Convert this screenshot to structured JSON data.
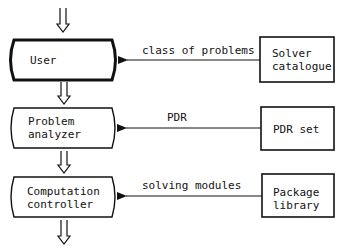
{
  "diagram": {
    "left_column": [
      {
        "id": "user",
        "label_lines": [
          "User"
        ],
        "emphasized": true
      },
      {
        "id": "problem-analyzer",
        "label_lines": [
          "Problem",
          "analyzer"
        ],
        "emphasized": false
      },
      {
        "id": "computation-controller",
        "label_lines": [
          "Computation",
          "controller"
        ],
        "emphasized": false
      }
    ],
    "right_column": [
      {
        "id": "solver-catalogue",
        "label_lines": [
          "Solver",
          "catalogue"
        ]
      },
      {
        "id": "pdr-set",
        "label_lines": [
          "PDR set"
        ]
      },
      {
        "id": "package-library",
        "label_lines": [
          "Package",
          "library"
        ]
      }
    ],
    "connections": [
      {
        "from": "solver-catalogue",
        "to": "user",
        "label": "class of problems"
      },
      {
        "from": "pdr-set",
        "to": "problem-analyzer",
        "label": "PDR"
      },
      {
        "from": "package-library",
        "to": "computation-controller",
        "label": "solving modules"
      }
    ],
    "flow_arrows": [
      "input-to-user",
      "user-to-problem-analyzer",
      "problem-analyzer-to-computation-controller",
      "computation-controller-to-output"
    ]
  }
}
